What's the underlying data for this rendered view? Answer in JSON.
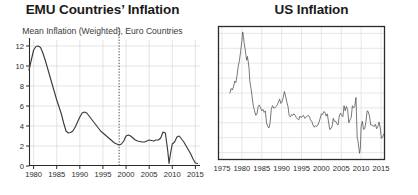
{
  "figure": {
    "background": "#ffffff",
    "line_color": "#3b3b3b",
    "grid_color": "#d9d9d9",
    "axis_color": "#2b2b2b"
  },
  "panels": [
    {
      "key": "emu",
      "title": "EMU Countries’ Inflation",
      "subtitle": "Mean Inflation (Weighted), Euro Countries"
    },
    {
      "key": "us",
      "title": "US Inflation",
      "subtitle": ""
    }
  ],
  "chart_data": [
    {
      "type": "line",
      "title": "EMU Countries’ Inflation",
      "subtitle": "Mean Inflation (Weighted), Euro Countries",
      "xlabel": "",
      "ylabel": "",
      "xlim": [
        1979,
        2016
      ],
      "ylim": [
        0,
        12.6
      ],
      "xticks": [
        1980,
        1985,
        1990,
        1995,
        2000,
        2005,
        2010,
        2015
      ],
      "yticks": [
        0,
        2,
        4,
        6,
        8,
        10,
        12
      ],
      "grid": true,
      "legend": "none",
      "annotations": [
        {
          "kind": "vline",
          "style": "dotted",
          "x": 1998.5,
          "label": ""
        }
      ],
      "series": [
        {
          "name": "Mean Inflation (Weighted), Euro Countries",
          "color": "#3b3b3b",
          "x": [
            1979.0,
            1979.5,
            1980.0,
            1980.5,
            1981.0,
            1981.5,
            1982.0,
            1982.5,
            1983.0,
            1983.5,
            1984.0,
            1984.5,
            1985.0,
            1985.5,
            1986.0,
            1986.5,
            1987.0,
            1987.5,
            1988.0,
            1988.5,
            1989.0,
            1989.5,
            1990.0,
            1990.5,
            1991.0,
            1991.5,
            1992.0,
            1992.5,
            1993.0,
            1993.5,
            1994.0,
            1994.5,
            1995.0,
            1995.5,
            1996.0,
            1996.5,
            1997.0,
            1997.5,
            1998.0,
            1998.5,
            1999.0,
            1999.5,
            2000.0,
            2000.5,
            2001.0,
            2001.5,
            2002.0,
            2002.5,
            2003.0,
            2003.5,
            2004.0,
            2004.5,
            2005.0,
            2005.5,
            2006.0,
            2006.5,
            2007.0,
            2007.5,
            2008.0,
            2008.5,
            2009.0,
            2009.3,
            2009.6,
            2010.0,
            2010.5,
            2011.0,
            2011.5,
            2012.0,
            2012.5,
            2013.0,
            2013.5,
            2014.0,
            2014.5,
            2015.0,
            2015.5
          ],
          "y": [
            9.6,
            10.6,
            11.6,
            11.95,
            12.0,
            11.85,
            11.3,
            10.6,
            9.8,
            9.0,
            8.2,
            7.4,
            6.6,
            5.9,
            5.2,
            4.3,
            3.5,
            3.3,
            3.35,
            3.5,
            3.9,
            4.4,
            4.9,
            5.3,
            5.4,
            5.3,
            5.0,
            4.7,
            4.4,
            4.1,
            3.8,
            3.5,
            3.3,
            3.1,
            2.9,
            2.7,
            2.5,
            2.3,
            2.2,
            2.1,
            2.2,
            2.5,
            3.0,
            3.1,
            3.0,
            2.8,
            2.6,
            2.5,
            2.45,
            2.4,
            2.4,
            2.5,
            2.6,
            2.55,
            2.5,
            2.6,
            2.6,
            2.8,
            3.4,
            3.3,
            1.6,
            0.25,
            1.2,
            2.2,
            2.4,
            2.9,
            3.0,
            2.7,
            2.4,
            2.0,
            1.6,
            1.2,
            0.7,
            0.3,
            0.25
          ]
        }
      ]
    },
    {
      "type": "line",
      "title": "US Inflation",
      "subtitle": "",
      "xlabel": "",
      "ylabel": "",
      "xlim": [
        1974,
        2016
      ],
      "ylim": [
        -3,
        15
      ],
      "xticks": [
        1975,
        1980,
        1985,
        1990,
        1995,
        2000,
        2005,
        2010,
        2015
      ],
      "yticks": [],
      "grid": true,
      "legend": "none",
      "frame": "box",
      "series": [
        {
          "name": "US Inflation",
          "color": "#555555",
          "x": [
            1977.0,
            1977.3,
            1977.6,
            1977.9,
            1978.2,
            1978.5,
            1978.8,
            1979.1,
            1979.4,
            1979.7,
            1980.0,
            1980.2,
            1980.4,
            1980.6,
            1980.8,
            1981.0,
            1981.2,
            1981.4,
            1981.6,
            1981.8,
            1982.0,
            1982.3,
            1982.6,
            1982.9,
            1983.2,
            1983.5,
            1983.8,
            1984.1,
            1984.4,
            1984.7,
            1985.0,
            1985.3,
            1985.6,
            1985.9,
            1986.2,
            1986.5,
            1986.8,
            1987.1,
            1987.4,
            1987.7,
            1988.0,
            1988.3,
            1988.6,
            1988.9,
            1989.2,
            1989.5,
            1989.8,
            1990.1,
            1990.4,
            1990.7,
            1991.0,
            1991.3,
            1991.6,
            1991.9,
            1992.2,
            1992.5,
            1992.8,
            1993.1,
            1993.4,
            1993.7,
            1994.0,
            1994.3,
            1994.6,
            1994.9,
            1995.2,
            1995.5,
            1995.8,
            1996.1,
            1996.4,
            1996.7,
            1997.0,
            1997.3,
            1997.6,
            1997.9,
            1998.2,
            1998.5,
            1998.8,
            1999.1,
            1999.4,
            1999.7,
            2000.0,
            2000.3,
            2000.6,
            2000.9,
            2001.2,
            2001.5,
            2001.8,
            2002.1,
            2002.4,
            2002.7,
            2003.0,
            2003.3,
            2003.6,
            2003.9,
            2004.2,
            2004.5,
            2004.8,
            2005.1,
            2005.4,
            2005.7,
            2006.0,
            2006.3,
            2006.6,
            2006.9,
            2007.2,
            2007.5,
            2007.8,
            2008.1,
            2008.4,
            2008.7,
            2009.0,
            2009.2,
            2009.4,
            2009.6,
            2009.8,
            2010.0,
            2010.3,
            2010.6,
            2010.9,
            2011.2,
            2011.5,
            2011.8,
            2012.1,
            2012.4,
            2012.7,
            2013.0,
            2013.3,
            2013.6,
            2013.9,
            2014.2,
            2014.5,
            2014.8,
            2015.1,
            2015.4,
            2015.7
          ],
          "y": [
            6.0,
            6.6,
            6.4,
            6.8,
            7.6,
            7.4,
            8.4,
            9.6,
            10.4,
            11.6,
            13.0,
            14.2,
            13.6,
            12.6,
            12.0,
            11.2,
            10.4,
            10.9,
            10.2,
            9.4,
            7.6,
            6.6,
            5.4,
            4.2,
            3.6,
            3.0,
            3.2,
            4.2,
            4.4,
            4.0,
            3.6,
            3.8,
            3.4,
            3.6,
            2.0,
            1.5,
            1.3,
            2.0,
            3.8,
            4.3,
            4.0,
            4.0,
            4.2,
            4.4,
            4.8,
            5.2,
            4.6,
            4.8,
            5.4,
            6.2,
            5.6,
            4.8,
            4.2,
            3.0,
            2.8,
            3.1,
            3.0,
            3.2,
            3.0,
            2.7,
            2.5,
            2.4,
            2.9,
            2.7,
            2.9,
            3.0,
            2.6,
            2.7,
            2.9,
            3.0,
            2.8,
            2.3,
            2.2,
            1.7,
            1.4,
            1.6,
            1.5,
            1.7,
            2.1,
            2.6,
            3.2,
            3.1,
            3.5,
            3.4,
            2.9,
            3.2,
            2.1,
            1.1,
            1.2,
            1.5,
            2.6,
            2.2,
            2.2,
            1.9,
            1.7,
            2.9,
            3.3,
            3.0,
            2.8,
            4.3,
            3.6,
            4.2,
            3.8,
            2.0,
            2.4,
            2.7,
            4.3,
            4.0,
            4.2,
            5.4,
            0.0,
            -0.4,
            -1.3,
            -2.1,
            -1.4,
            1.5,
            2.2,
            1.1,
            1.2,
            2.1,
            3.6,
            3.5,
            2.9,
            1.7,
            1.7,
            1.6,
            1.5,
            1.8,
            1.2,
            1.5,
            2.1,
            1.3,
            -0.1,
            0.1,
            0.5
          ]
        }
      ]
    }
  ]
}
